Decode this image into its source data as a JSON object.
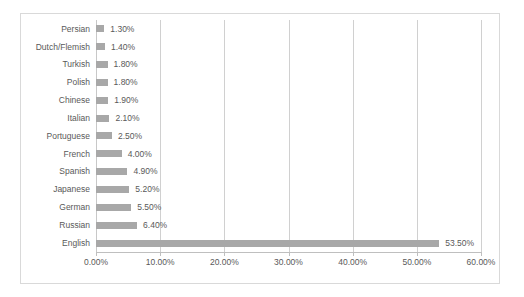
{
  "chart_data": {
    "type": "bar",
    "orientation": "horizontal",
    "title": "",
    "subtitle": "",
    "xlabel": "",
    "ylabel": "",
    "xlim": [
      0,
      60
    ],
    "xtick_labels": [
      "0.00%",
      "10.00%",
      "20.00%",
      "30.00%",
      "40.00%",
      "50.00%",
      "60.00%"
    ],
    "xtick_values": [
      0,
      10,
      20,
      30,
      40,
      50,
      60
    ],
    "grid": true,
    "legend": false,
    "legend_position": "none",
    "bar_color": "#a8a8a8",
    "text_color": "#595959",
    "border_color": "#d9d9d9",
    "gridline_color": "#d0d0d0",
    "categories": [
      "Persian",
      "Dutch/Flemish",
      "Turkish",
      "Polish",
      "Chinese",
      "Italian",
      "Portuguese",
      "French",
      "Spanish",
      "Japanese",
      "German",
      "Russian",
      "English"
    ],
    "values": [
      1.3,
      1.4,
      1.8,
      1.8,
      1.9,
      2.1,
      2.5,
      4.0,
      4.9,
      5.2,
      5.5,
      6.4,
      53.5
    ],
    "data_labels": [
      "1.30%",
      "1.40%",
      "1.80%",
      "1.80%",
      "1.90%",
      "2.10%",
      "2.50%",
      "4.00%",
      "4.90%",
      "5.20%",
      "5.50%",
      "6.40%",
      "53.50%"
    ]
  }
}
